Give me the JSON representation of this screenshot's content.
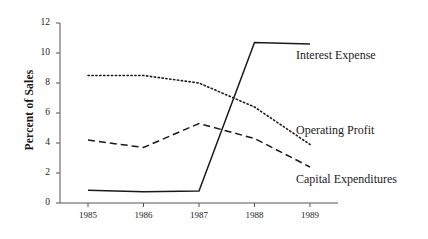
{
  "chart_data": {
    "type": "line",
    "title": "",
    "xlabel": "",
    "ylabel": "Percent of Sales",
    "categories": [
      "1985",
      "1986",
      "1987",
      "1988",
      "1989"
    ],
    "x": [
      1985,
      1986,
      1987,
      1988,
      1989
    ],
    "ylim": [
      0,
      12
    ],
    "yticks": [
      0,
      2,
      4,
      6,
      8,
      10,
      12
    ],
    "ytick_labels": [
      "0",
      "2",
      "4",
      "6",
      "8",
      "10",
      "12"
    ],
    "grid": false,
    "legend_position": "inline-right-annotations",
    "series": [
      {
        "name": "Interest Expense",
        "style": "solid",
        "color": "#1a1a1a",
        "values": [
          0.85,
          0.75,
          0.8,
          10.7,
          10.6
        ]
      },
      {
        "name": "Operating Profit",
        "style": "dotted",
        "color": "#1a1a1a",
        "values": [
          8.5,
          8.5,
          8.0,
          6.4,
          3.9
        ]
      },
      {
        "name": "Capital Expenditures",
        "style": "dashed",
        "color": "#1a1a1a",
        "values": [
          4.2,
          3.7,
          5.3,
          4.3,
          2.4
        ]
      }
    ],
    "annotations": [
      {
        "text": "Interest Expense",
        "series": "Interest Expense"
      },
      {
        "text": "Operating Profit",
        "series": "Operating Profit"
      },
      {
        "text": "Capital Expenditures",
        "series": "Capital Expenditures"
      }
    ]
  },
  "axes": {
    "y_title": "Percent of Sales"
  }
}
